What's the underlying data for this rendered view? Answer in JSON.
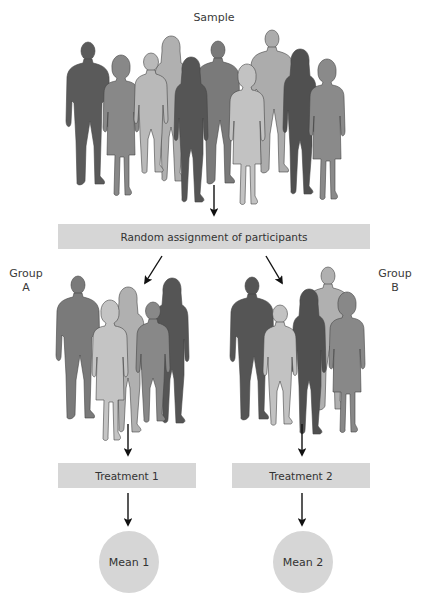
{
  "diagram": {
    "title": "Sample",
    "assignment_label": "Random assignment of participants",
    "groups": [
      {
        "label_line1": "Group",
        "label_line2": "A",
        "treatment": "Treatment 1",
        "outcome": "Mean 1"
      },
      {
        "label_line1": "Group",
        "label_line2": "B",
        "treatment": "Treatment 2",
        "outcome": "Mean 2"
      }
    ],
    "colors": {
      "box_fill": "#d6d6d6",
      "arrow": "#111111",
      "figure_dark": "#555555",
      "figure_mid": "#7a7a7a",
      "figure_light": "#b8b8b8",
      "figure_lighter": "#a4a4a4"
    },
    "sample_size": 10,
    "group_a_size": 5,
    "group_b_size": 5
  }
}
